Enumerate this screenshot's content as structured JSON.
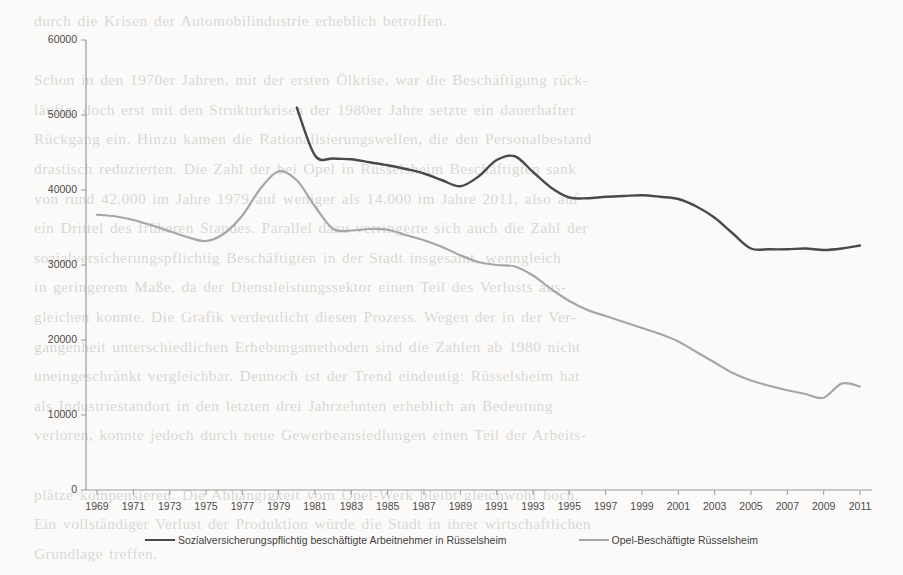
{
  "page": {
    "background_text": "durch die Krisen der Automobilindustrie erheblich betroffen.\n\nSchon in den 1970er Jahren, mit der ersten Ölkrise, war die Beschäftigung rück-\nläufig, doch erst mit den Strukturkrisen der 1980er Jahre setzte ein dauerhafter\nRückgang ein. Hinzu kamen die Rationalisierungswellen, die den Personalbestand\ndrastisch reduzierten. Die Zahl der bei Opel in Rüsselsheim Beschäftigten sank\nvon rund 42.000 im Jahre 1979 auf weniger als 14.000 im Jahre 2011, also auf\nein Drittel des früheren Standes. Parallel dazu verringerte sich auch die Zahl der\nsozialversicherungspflichtig Beschäftigten in der Stadt insgesamt, wenngleich\nin geringerem Maße, da der Dienstleistungssektor einen Teil des Verlusts aus-\ngleichen konnte. Die Grafik verdeutlicht diesen Prozess. Wegen der in der Ver-\ngangenheit unterschiedlichen Erhebungsmethoden sind die Zahlen ab 1980 nicht\nuneingeschränkt vergleichbar. Dennoch ist der Trend eindeutig: Rüsselsheim hat\nals Industriestandort in den letzten drei Jahrzehnten erheblich an Bedeutung\nverloren, konnte jedoch durch neue Gewerbeansiedlungen einen Teil der Arbeits-\n\nplätze kompensieren. Die Abhängigkeit vom Opel-Werk bleibt gleichwohl hoch.\nEin vollständiger Verlust der Produktion würde die Stadt in ihrer wirtschaftlichen\nGrundlage treffen."
  },
  "chart_data": {
    "type": "line",
    "title": "",
    "subtitle": "",
    "xlabel": "",
    "ylabel": "",
    "grid": false,
    "legend_position": "bottom",
    "xlim": [
      1969,
      2011
    ],
    "ylim": [
      0,
      60000
    ],
    "ytick_step": 10000,
    "xtick_step": 2,
    "yticks": [
      0,
      10000,
      20000,
      30000,
      40000,
      50000,
      60000
    ],
    "ytick_labels": [
      "0",
      "10000",
      "20000",
      "30000",
      "40000",
      "50000",
      "60000"
    ],
    "xticks": [
      1969,
      1971,
      1973,
      1975,
      1977,
      1979,
      1981,
      1983,
      1985,
      1987,
      1989,
      1991,
      1993,
      1995,
      1997,
      1999,
      2001,
      2003,
      2005,
      2007,
      2009,
      2011
    ],
    "xtick_labels": [
      "1969",
      "1971",
      "1973",
      "1975",
      "1977",
      "1979",
      "1981",
      "1983",
      "1985",
      "1987",
      "1989",
      "1991",
      "1993",
      "1995",
      "1997",
      "1999",
      "2001",
      "2003",
      "2005",
      "2007",
      "2009",
      "2011"
    ],
    "series": [
      {
        "name": "Sozialversicherungspflichtig beschäftigte Arbeitnehmer in Rüsselsheim",
        "color": "#494949",
        "width": 2.4,
        "x": [
          1980,
          1981,
          1982,
          1983,
          1984,
          1985,
          1986,
          1987,
          1988,
          1989,
          1990,
          1991,
          1992,
          1993,
          1994,
          1995,
          1996,
          1997,
          1998,
          1999,
          2000,
          2001,
          2002,
          2003,
          2004,
          2005,
          2006,
          2007,
          2008,
          2009,
          2010,
          2011
        ],
        "y": [
          51000,
          44600,
          44200,
          44100,
          43700,
          43300,
          42800,
          42200,
          41300,
          40500,
          41800,
          44000,
          44500,
          42400,
          40300,
          39000,
          38900,
          39100,
          39200,
          39300,
          39100,
          38800,
          37800,
          36300,
          34200,
          32200,
          32100,
          32100,
          32200,
          32000,
          32200,
          32600
        ]
      },
      {
        "name": "Opel-Beschäftigte Rüsselsheim",
        "color": "#a6a6a6",
        "width": 2.2,
        "x": [
          1969,
          1970,
          1971,
          1972,
          1973,
          1974,
          1975,
          1976,
          1977,
          1978,
          1979,
          1980,
          1981,
          1982,
          1983,
          1984,
          1985,
          1986,
          1987,
          1988,
          1989,
          1990,
          1991,
          1992,
          1993,
          1994,
          1995,
          1996,
          1997,
          1998,
          1999,
          2000,
          2001,
          2002,
          2003,
          2004,
          2005,
          2006,
          2007,
          2008,
          2009,
          2010,
          2011
        ],
        "y": [
          36700,
          36500,
          36000,
          35300,
          34500,
          33700,
          33200,
          34200,
          36600,
          40200,
          42500,
          41300,
          37800,
          34800,
          34600,
          34800,
          34700,
          34000,
          33300,
          32400,
          31300,
          30400,
          30000,
          29800,
          28600,
          26800,
          25200,
          24000,
          23200,
          22400,
          21600,
          20800,
          19800,
          18400,
          17000,
          15600,
          14600,
          13900,
          13300,
          12800,
          12300,
          14200,
          13800
        ]
      }
    ]
  },
  "legend": {
    "items": [
      {
        "label": "Sozialversicherungspflichtig beschäftigte Arbeitnehmer in Rüsselsheim",
        "color": "#494949"
      },
      {
        "label": "Opel-Beschäftigte Rüsselsheim",
        "color": "#a6a6a6"
      }
    ]
  },
  "axis": {
    "line_color": "#9a9a9a",
    "tick_color": "#4a4a4a"
  }
}
